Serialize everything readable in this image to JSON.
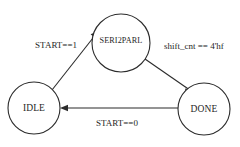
{
  "diagram": {
    "background_color": "#ffffff",
    "line_color": "#2b2b2b",
    "text_color": "#262626",
    "states": [
      {
        "id": "idle",
        "label": "IDLE",
        "cx": 34,
        "cy": 108,
        "r": 26
      },
      {
        "id": "seri2parl",
        "label": "SERI2PARL",
        "cx": 121,
        "cy": 43,
        "r": 29
      },
      {
        "id": "done",
        "label": "DONE",
        "cx": 204,
        "cy": 109,
        "r": 26
      }
    ],
    "transitions": [
      {
        "id": "idle-to-seri2parl",
        "from": "IDLE",
        "to": "SERI2PARL",
        "label": "START==1"
      },
      {
        "id": "seri2parl-to-done",
        "from": "SERI2PARL",
        "to": "DONE",
        "label": "shift_cnt == 4'hf"
      },
      {
        "id": "done-to-idle",
        "from": "DONE",
        "to": "IDLE",
        "label": "START==0"
      }
    ]
  }
}
